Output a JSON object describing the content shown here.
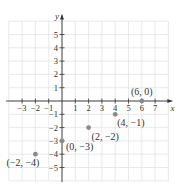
{
  "chart_data": {
    "type": "scatter",
    "title": "",
    "xlabel": "x",
    "ylabel": "y",
    "xlim": [
      -4,
      8
    ],
    "ylim": [
      -6,
      6
    ],
    "grid": true,
    "x_ticks": [
      -3,
      -2,
      -1,
      1,
      2,
      3,
      4,
      5,
      6,
      7
    ],
    "y_ticks": [
      -5,
      -4,
      -3,
      -2,
      -1,
      1,
      2,
      3,
      4,
      5
    ],
    "points": [
      {
        "x": 6,
        "y": 0,
        "label": "(6, 0)"
      },
      {
        "x": 4,
        "y": -1,
        "label": "(4, −1)"
      },
      {
        "x": 2,
        "y": -2,
        "label": "(2, −2)"
      },
      {
        "x": 0,
        "y": -3,
        "label": "(0, −3)"
      },
      {
        "x": -2,
        "y": -4,
        "label": "(−2, −4)"
      }
    ],
    "point_color": "#8a8a8a"
  }
}
